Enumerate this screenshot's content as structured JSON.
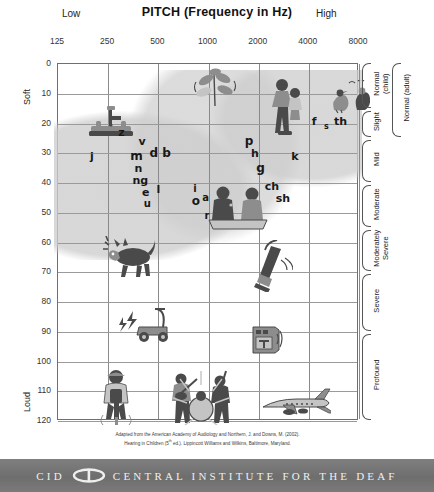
{
  "header": {
    "title": "PITCH (Frequency in Hz)",
    "low_label": "Low",
    "high_label": "High"
  },
  "axes": {
    "y_title": "LOUDNESS (Intensity in dB HL)",
    "y_top_word": "Soft",
    "y_bottom_word": "Loud",
    "x_ticks": [
      "125",
      "250",
      "500",
      "1000",
      "2000",
      "4000",
      "8000"
    ],
    "y_ticks": [
      "0",
      "10",
      "20",
      "30",
      "40",
      "50",
      "60",
      "70",
      "80",
      "90",
      "100",
      "110",
      "120"
    ]
  },
  "severity": {
    "brackets": [
      {
        "label": "Normal\n(child)",
        "from_db": 0,
        "to_db": 15
      },
      {
        "label": "Slight",
        "from_db": 16,
        "to_db": 25
      },
      {
        "label": "Mild",
        "from_db": 26,
        "to_db": 40
      },
      {
        "label": "Moderate",
        "from_db": 41,
        "to_db": 55
      },
      {
        "label": "Moderately\nSevere",
        "from_db": 56,
        "to_db": 70
      },
      {
        "label": "Severe",
        "from_db": 71,
        "to_db": 90
      },
      {
        "label": "Profound",
        "from_db": 91,
        "to_db": 120
      }
    ],
    "outer_bracket": {
      "label": "Normal (adult)",
      "from_db": 0,
      "to_db": 25
    }
  },
  "citation": {
    "line1": "Adapted from the American Academy of Audiology and Northern, J. and Downs, M. (2002).",
    "line2_pre": "Hearing in Children (5",
    "line2_sup": "th",
    "line2_post": " ed.). Lippincott Williams and Wilkins, Baltimore, Maryland."
  },
  "footer": {
    "abbr": "CID",
    "name": "CENTRAL INSTITUTE FOR THE DEAF",
    "logo_name": "cid-oval-logo"
  },
  "chart_data": {
    "type": "scatter",
    "xlabel": "PITCH (Frequency in Hz)",
    "ylabel": "LOUDNESS (Intensity in dB HL)",
    "xscale": "log",
    "xlim": [
      125,
      8000
    ],
    "ylim": [
      0,
      120
    ],
    "y_inverted": true,
    "grid": true,
    "x_tick_values": [
      125,
      250,
      500,
      1000,
      2000,
      4000,
      8000
    ],
    "y_tick_values": [
      0,
      10,
      20,
      30,
      40,
      50,
      60,
      70,
      80,
      90,
      100,
      110,
      120
    ],
    "speech_sounds": [
      {
        "text": "z",
        "freq_hz": 300,
        "db": 23,
        "size": 11
      },
      {
        "text": "v",
        "freq_hz": 400,
        "db": 26,
        "size": 11
      },
      {
        "text": "j",
        "freq_hz": 200,
        "db": 31,
        "size": 11
      },
      {
        "text": "m",
        "freq_hz": 370,
        "db": 31,
        "size": 12
      },
      {
        "text": "d",
        "freq_hz": 470,
        "db": 30,
        "size": 12
      },
      {
        "text": "b",
        "freq_hz": 560,
        "db": 30,
        "size": 12
      },
      {
        "text": "n",
        "freq_hz": 380,
        "db": 35,
        "size": 11
      },
      {
        "text": "ng",
        "freq_hz": 390,
        "db": 39,
        "size": 11
      },
      {
        "text": "e",
        "freq_hz": 420,
        "db": 43,
        "size": 11
      },
      {
        "text": "l",
        "freq_hz": 500,
        "db": 42,
        "size": 11
      },
      {
        "text": "u",
        "freq_hz": 430,
        "db": 47,
        "size": 10
      },
      {
        "text": "i",
        "freq_hz": 830,
        "db": 42,
        "size": 10
      },
      {
        "text": "o",
        "freq_hz": 840,
        "db": 46,
        "size": 12
      },
      {
        "text": "a",
        "freq_hz": 960,
        "db": 45,
        "size": 10
      },
      {
        "text": "r",
        "freq_hz": 980,
        "db": 51,
        "size": 10
      },
      {
        "text": "p",
        "freq_hz": 1750,
        "db": 26,
        "size": 12
      },
      {
        "text": "h",
        "freq_hz": 1900,
        "db": 30,
        "size": 11
      },
      {
        "text": "g",
        "freq_hz": 2050,
        "db": 35,
        "size": 12
      },
      {
        "text": "k",
        "freq_hz": 3300,
        "db": 31,
        "size": 11
      },
      {
        "text": "ch",
        "freq_hz": 2400,
        "db": 41,
        "size": 11
      },
      {
        "text": "sh",
        "freq_hz": 2800,
        "db": 45,
        "size": 11
      },
      {
        "text": "f",
        "freq_hz": 4300,
        "db": 19,
        "size": 11
      },
      {
        "text": "s",
        "freq_hz": 5100,
        "db": 21,
        "size": 8
      },
      {
        "text": "th",
        "freq_hz": 6200,
        "db": 19,
        "size": 11
      }
    ],
    "familiar_sounds": [
      {
        "name": "faucet-dripping",
        "label": "Water faucet dripping",
        "freq_hz": 260,
        "db": 19
      },
      {
        "name": "leaves-rustling",
        "label": "Leaves rustling",
        "freq_hz": 1100,
        "db": 8
      },
      {
        "name": "mother-and-child",
        "label": "Whispered speech",
        "freq_hz": 3000,
        "db": 14
      },
      {
        "name": "birds-chirping",
        "label": "Birds chirping",
        "freq_hz": 6800,
        "db": 11
      },
      {
        "name": "two-people-talking",
        "label": "Conversational speech",
        "freq_hz": 1500,
        "db": 48
      },
      {
        "name": "dog-barking",
        "label": "Dog barking",
        "freq_hz": 340,
        "db": 65
      },
      {
        "name": "vacuum-cleaner",
        "label": "Vacuum cleaner",
        "freq_hz": 2400,
        "db": 68
      },
      {
        "name": "lawn-mower",
        "label": "Lawn mower",
        "freq_hz": 420,
        "db": 87
      },
      {
        "name": "radio-speaker",
        "label": "Radio / speaker",
        "freq_hz": 2200,
        "db": 92
      },
      {
        "name": "jackhammer",
        "label": "Jackhammer",
        "freq_hz": 280,
        "db": 112
      },
      {
        "name": "rock-band",
        "label": "Rock band",
        "freq_hz": 900,
        "db": 112
      },
      {
        "name": "jet-airplane",
        "label": "Jet airplane",
        "freq_hz": 3300,
        "db": 115
      }
    ],
    "shaded_region": {
      "name": "speech-banana",
      "color": "#cdcdcd"
    }
  }
}
